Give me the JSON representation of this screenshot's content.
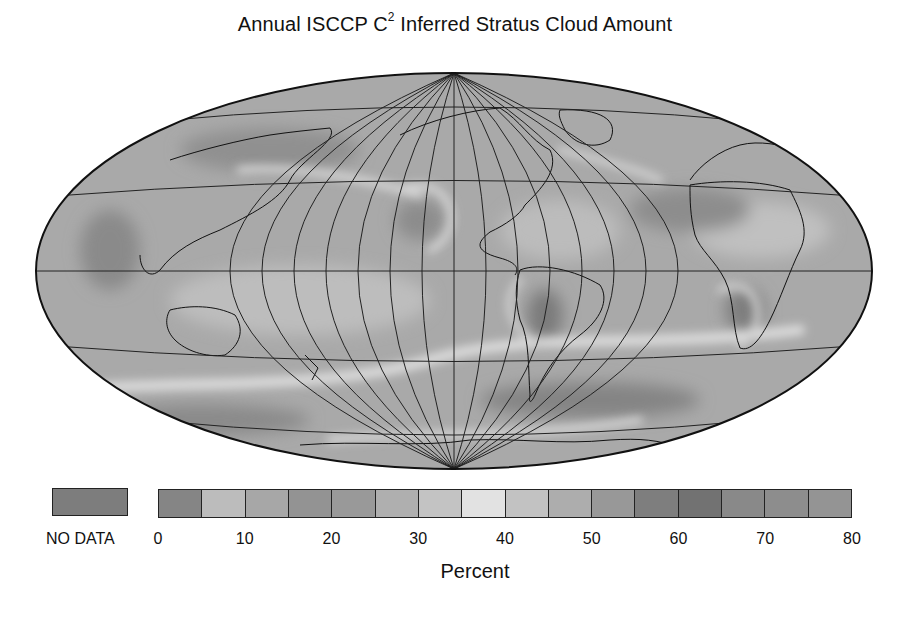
{
  "figure": {
    "title_prefix": "Annual ISCCP C",
    "title_sup": "2",
    "title_suffix": " Inferred Stratus Cloud Amount"
  },
  "map": {
    "projection": "Hammer (equal-area) global",
    "graticule": {
      "meridians_deg": [
        -165,
        -150,
        -135,
        -120,
        -105,
        -90,
        -75,
        -60,
        -45,
        -30,
        -15,
        0,
        15,
        30,
        45,
        60,
        75,
        90,
        105,
        120,
        135,
        150,
        165
      ],
      "parallels_deg": [
        -60,
        -30,
        0,
        30,
        60
      ]
    },
    "central_meridian_note": "Pacific-centered, Americas near center",
    "background_shade": "#a9a9a9"
  },
  "legend": {
    "no_data_label": "NO DATA",
    "no_data_color": "#7d7d7d",
    "unit_label": "Percent",
    "tick_labels": [
      "0",
      "10",
      "20",
      "30",
      "40",
      "50",
      "60",
      "70",
      "80"
    ],
    "bins": [
      {
        "range": "0-5",
        "color": "#858585"
      },
      {
        "range": "5-10",
        "color": "#bcbcbc"
      },
      {
        "range": "10-15",
        "color": "#a7a7a7"
      },
      {
        "range": "15-20",
        "color": "#939393"
      },
      {
        "range": "20-25",
        "color": "#999999"
      },
      {
        "range": "25-30",
        "color": "#afafaf"
      },
      {
        "range": "30-35",
        "color": "#c3c3c3"
      },
      {
        "range": "35-40",
        "color": "#e2e2e2"
      },
      {
        "range": "40-45",
        "color": "#c2c2c2"
      },
      {
        "range": "45-50",
        "color": "#adadad"
      },
      {
        "range": "50-55",
        "color": "#989898"
      },
      {
        "range": "55-60",
        "color": "#7e7e7e"
      },
      {
        "range": "60-65",
        "color": "#727272"
      },
      {
        "range": "65-70",
        "color": "#898989"
      },
      {
        "range": "70-75",
        "color": "#8d8d8d"
      },
      {
        "range": "75-80",
        "color": "#949494"
      }
    ]
  },
  "chart_data": {
    "type": "heatmap",
    "title": "Annual ISCCP C2 Inferred Stratus Cloud Amount",
    "colorbar": {
      "label": "Percent",
      "range": [
        0,
        80
      ],
      "step": 5,
      "ticks": [
        0,
        10,
        20,
        30,
        40,
        50,
        60,
        70,
        80
      ],
      "no_data_category": "NO DATA"
    },
    "notable_features": [
      "High stratus over subtropical eastern Pacific off California (~55-60%)",
      "High stratus off Peru/Chile (~55-65%)",
      "High stratus off southwest Africa/Namibia (~55-65%)",
      "Bright low-value bands (~35-40%) along Southern Ocean and N. Pacific storm tracks",
      "High values over Southern Ocean ~50-60S (~55-65%)"
    ]
  }
}
